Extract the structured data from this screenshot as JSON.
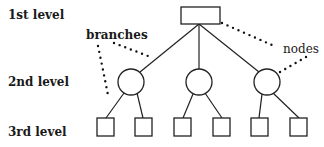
{
  "diagram": {
    "type": "tree",
    "levels": [
      {
        "label": "1st level",
        "shape": "rectangle",
        "count": 1
      },
      {
        "label": "2nd level",
        "shape": "circle",
        "count": 3
      },
      {
        "label": "3rd level",
        "shape": "square",
        "count": 6
      }
    ],
    "annotations": {
      "branches": "branches",
      "nodes": "nodes"
    },
    "colors": {
      "stroke": "#222222",
      "background": "#ffffff"
    }
  }
}
